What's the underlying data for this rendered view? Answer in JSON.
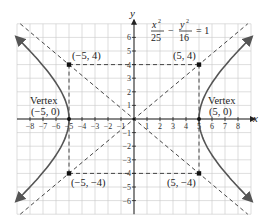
{
  "figure": {
    "equation": {
      "term1_num": "x",
      "term1_num_exp": "2",
      "term1_den": "25",
      "minus": "−",
      "term2_num": "y",
      "term2_num_exp": "2",
      "term2_den": "16",
      "equals": "= 1"
    },
    "axes": {
      "x_label": "x",
      "y_label": "y",
      "x_ticks": [
        "−8",
        "−7",
        "−6",
        "−5",
        "−4",
        "−3",
        "−2",
        "−1",
        "1",
        "2",
        "3",
        "4",
        "5",
        "6",
        "7",
        "8"
      ],
      "x_tick_values": [
        -8,
        -7,
        -6,
        -5,
        -4,
        -3,
        -2,
        -1,
        1,
        2,
        3,
        4,
        5,
        6,
        7,
        8
      ],
      "y_ticks": [
        "6",
        "5",
        "4",
        "3",
        "2",
        "1",
        "−1",
        "−2",
        "−3",
        "−4",
        "−5",
        "−6"
      ],
      "y_tick_values": [
        6,
        5,
        4,
        3,
        2,
        1,
        -1,
        -2,
        -3,
        -4,
        -5,
        -6
      ],
      "x_range": [
        -9,
        9
      ],
      "y_range": [
        -7,
        7
      ]
    },
    "points": [
      {
        "label": "(−5, 4)",
        "x": -5,
        "y": 4
      },
      {
        "label": "(5, 4)",
        "x": 5,
        "y": 4
      },
      {
        "label": "(−5, −4)",
        "x": -5,
        "y": -4
      },
      {
        "label": "(5, −4)",
        "x": 5,
        "y": -4
      }
    ],
    "vertices": [
      {
        "title": "Vertex",
        "label": "(−5, 0)",
        "x": -5,
        "y": 0
      },
      {
        "title": "Vertex",
        "label": "(5, 0)",
        "x": 5,
        "y": 0
      }
    ],
    "asymptotes": [
      "y = 4x/5",
      "y = −4x/5"
    ],
    "colors": {
      "curve": "#555555",
      "grid": "#c8c8c8",
      "axis": "#222222",
      "dashed": "#333333"
    }
  }
}
